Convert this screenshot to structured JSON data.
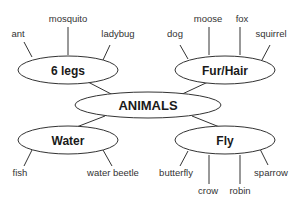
{
  "diagram": {
    "type": "concept-map",
    "center": "ANIMALS",
    "categories": [
      {
        "label": "6 legs",
        "items": [
          "ant",
          "mosquito",
          "ladybug"
        ]
      },
      {
        "label": "Fur/Hair",
        "items": [
          "dog",
          "moose",
          "fox",
          "squirrel"
        ]
      },
      {
        "label": "Water",
        "items": [
          "fish",
          "water beetle"
        ]
      },
      {
        "label": "Fly",
        "items": [
          "butterfly",
          "crow",
          "robin",
          "sparrow"
        ]
      }
    ]
  }
}
